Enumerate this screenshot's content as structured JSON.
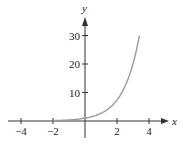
{
  "chart_data": {
    "type": "line",
    "title": "",
    "function": "y = e^x",
    "xlabel": "x",
    "ylabel": "y",
    "xlim": [
      -4.8,
      5
    ],
    "ylim": [
      -6,
      36
    ],
    "x_ticks": [
      -4,
      -2,
      2,
      4
    ],
    "x_tick_labels": [
      "−4",
      "−2",
      "2",
      "4"
    ],
    "y_ticks": [
      10,
      20,
      30
    ],
    "y_tick_labels": [
      "10",
      "20",
      "30"
    ],
    "grid": false,
    "legend": null,
    "series": [
      {
        "name": "y = e^x",
        "color": "#9a9a9a",
        "x": [
          -2,
          -1.5,
          -1,
          -0.5,
          0,
          0.5,
          1,
          1.5,
          2,
          2.5,
          3,
          3.2,
          3.4
        ],
        "y": [
          0.14,
          0.22,
          0.37,
          0.61,
          1,
          1.65,
          2.72,
          4.48,
          7.39,
          12.18,
          20.09,
          24.53,
          29.96
        ]
      }
    ]
  },
  "colors": {
    "axis": "#333333",
    "curve": "#9a9a9a",
    "text": "#222222"
  }
}
